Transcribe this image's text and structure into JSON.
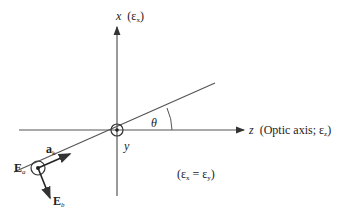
{
  "diagram": {
    "axes": {
      "x": {
        "symbol": "x",
        "label_suffix": "(ε",
        "sub": "x",
        "close": ")"
      },
      "z": {
        "symbol": "z",
        "text": "(Optic axis; ε",
        "sub": "z",
        "close": ")"
      },
      "y": {
        "symbol": "y"
      }
    },
    "angle": {
      "symbol": "θ"
    },
    "vectors": {
      "propagation": {
        "bold": "a",
        "sub": "k"
      },
      "Ea": {
        "bold": "E",
        "sub": "a"
      },
      "Eb": {
        "bold": "E",
        "sub": "b"
      }
    },
    "condition": {
      "open": "(ε",
      "sub1": "x",
      "eq": " = ε",
      "sub2": "y",
      "close": ")"
    },
    "colors": {
      "line": "#555555",
      "text": "#222222"
    }
  }
}
